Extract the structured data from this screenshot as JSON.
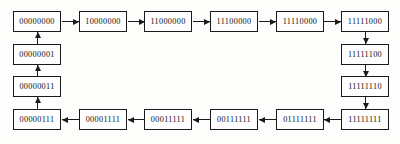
{
  "diagram": {
    "type": "state-cycle",
    "background_color": "#fdfdfc",
    "node_border_color": "#1a1a1a",
    "arrow_color": "#1a1a1a",
    "nodes": [
      {
        "id": "n0",
        "label": "00000000",
        "x": 13,
        "y": 11,
        "row": "top",
        "col": 0
      },
      {
        "id": "n1",
        "label": "10000000",
        "x": 79,
        "y": 11,
        "row": "top",
        "col": 1
      },
      {
        "id": "n2",
        "label": "11000000",
        "x": 144,
        "y": 11,
        "row": "top",
        "col": 2
      },
      {
        "id": "n3",
        "label": "11100000",
        "x": 210,
        "y": 11,
        "row": "top",
        "col": 3
      },
      {
        "id": "n4",
        "label": "11110000",
        "x": 276,
        "y": 11,
        "row": "top",
        "col": 4
      },
      {
        "id": "n5",
        "label": "11111000",
        "x": 341,
        "y": 11,
        "row": "top",
        "col": 5
      },
      {
        "id": "n6",
        "label": "11111100",
        "x": 341,
        "y": 44,
        "row": "right",
        "col": 5
      },
      {
        "id": "n7",
        "label": "11111110",
        "x": 341,
        "y": 76,
        "row": "right",
        "col": 5
      },
      {
        "id": "n8",
        "label": "11111111",
        "x": 341,
        "y": 109,
        "row": "bottom",
        "col": 5
      },
      {
        "id": "n9",
        "label": "01111111",
        "x": 276,
        "y": 109,
        "row": "bottom",
        "col": 4
      },
      {
        "id": "n10",
        "label": "00111111",
        "x": 210,
        "y": 109,
        "row": "bottom",
        "col": 3
      },
      {
        "id": "n11",
        "label": "00011111",
        "x": 144,
        "y": 109,
        "row": "bottom",
        "col": 2
      },
      {
        "id": "n12",
        "label": "00001111",
        "x": 79,
        "y": 109,
        "row": "bottom",
        "col": 1
      },
      {
        "id": "n13",
        "label": "00000111",
        "x": 13,
        "y": 109,
        "row": "bottom",
        "col": 0
      },
      {
        "id": "n14",
        "label": "00000011",
        "x": 13,
        "y": 76,
        "row": "left",
        "col": 0
      },
      {
        "id": "n15",
        "label": "00000001",
        "x": 13,
        "y": 44,
        "row": "left",
        "col": 0
      }
    ],
    "edges": [
      {
        "id": "e0",
        "from": "n0",
        "to": "n1",
        "direction": "right",
        "x": 62,
        "y": 18
      },
      {
        "id": "e1",
        "from": "n1",
        "to": "n2",
        "direction": "right",
        "x": 128,
        "y": 18
      },
      {
        "id": "e2",
        "from": "n2",
        "to": "n3",
        "direction": "right",
        "x": 193,
        "y": 18
      },
      {
        "id": "e3",
        "from": "n3",
        "to": "n4",
        "direction": "right",
        "x": 259,
        "y": 18
      },
      {
        "id": "e4",
        "from": "n4",
        "to": "n5",
        "direction": "right",
        "x": 324,
        "y": 18
      },
      {
        "id": "e5",
        "from": "n5",
        "to": "n6",
        "direction": "down",
        "x": 362,
        "y": 32
      },
      {
        "id": "e6",
        "from": "n6",
        "to": "n7",
        "direction": "down",
        "x": 362,
        "y": 65
      },
      {
        "id": "e7",
        "from": "n7",
        "to": "n8",
        "direction": "down",
        "x": 362,
        "y": 97
      },
      {
        "id": "e8",
        "from": "n8",
        "to": "n9",
        "direction": "left",
        "x": 324,
        "y": 116
      },
      {
        "id": "e9",
        "from": "n9",
        "to": "n10",
        "direction": "left",
        "x": 259,
        "y": 116
      },
      {
        "id": "e10",
        "from": "n10",
        "to": "n11",
        "direction": "left",
        "x": 193,
        "y": 116
      },
      {
        "id": "e11",
        "from": "n11",
        "to": "n12",
        "direction": "left",
        "x": 128,
        "y": 116
      },
      {
        "id": "e12",
        "from": "n12",
        "to": "n13",
        "direction": "left",
        "x": 62,
        "y": 116
      },
      {
        "id": "e13",
        "from": "n13",
        "to": "n14",
        "direction": "up",
        "x": 34,
        "y": 97
      },
      {
        "id": "e14",
        "from": "n14",
        "to": "n15",
        "direction": "up",
        "x": 34,
        "y": 65
      },
      {
        "id": "e15",
        "from": "n15",
        "to": "n0",
        "direction": "up",
        "x": 34,
        "y": 32
      }
    ]
  }
}
